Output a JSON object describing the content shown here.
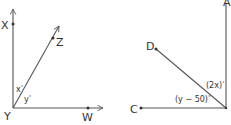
{
  "figures": [
    {
      "id": "left",
      "vertex": "Y",
      "rays": [
        "X",
        "Z",
        "W"
      ],
      "labels": {
        "X": "X",
        "Y": "Y",
        "Z": "Z",
        "W": "W"
      },
      "angles": {
        "XYZ": "x",
        "ZYW": "y"
      }
    },
    {
      "id": "right",
      "vertex": "unlabeled",
      "rays": [
        "A",
        "D",
        "C"
      ],
      "labels": {
        "A": "A",
        "D": "D",
        "C": "C"
      },
      "angles": {
        "ADangle": "(2x)",
        "DCangle": "(y − 50)"
      }
    }
  ],
  "degree_symbol": "°",
  "colors": {
    "line": "#555555",
    "text": "#333333",
    "background": "#ffffff"
  }
}
